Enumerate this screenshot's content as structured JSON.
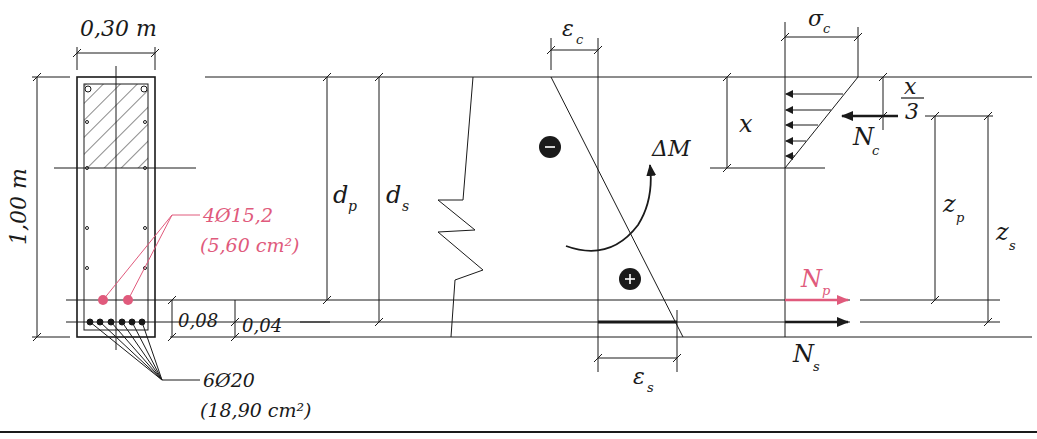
{
  "colors": {
    "ink": "#1a1a1a",
    "prestress": "#e05a7c",
    "background": "#ffffff"
  },
  "section": {
    "width_label": "0,30 m",
    "height_label": "1,00 m",
    "prestress_label": "4Ø15,2",
    "prestress_area": "(5,60 cm²)",
    "steel_label": "6Ø20",
    "steel_area": "(18,90 cm²)",
    "dim_008": "0,08",
    "dim_004": "0,04"
  },
  "depths": {
    "dp": "d",
    "dp_sub": "p",
    "ds": "d",
    "ds_sub": "s"
  },
  "strain": {
    "eps_c": "ε",
    "eps_c_sub": "c",
    "eps_s": "ε",
    "eps_s_sub": "s",
    "minus_sign": "−",
    "plus_sign": "+",
    "moment": "ΔM"
  },
  "stress": {
    "sigma_c": "σ",
    "sigma_c_sub": "c",
    "x": "x",
    "x_over_3_num": "x",
    "x_over_3_den": "3",
    "Nc": "N",
    "Nc_sub": "c",
    "Np": "N",
    "Np_sub": "p",
    "Ns": "N",
    "Ns_sub": "s",
    "zp": "z",
    "zp_sub": "p",
    "zs": "z",
    "zs_sub": "s"
  }
}
